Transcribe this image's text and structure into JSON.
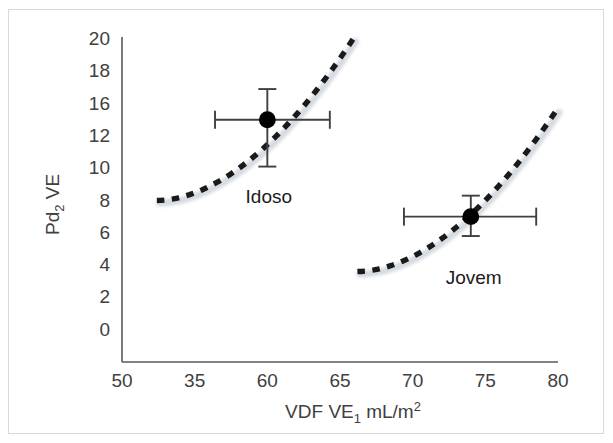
{
  "chart_data": {
    "type": "scatter",
    "title": "",
    "xlabel": "VDF VE₁ mL/m²",
    "ylabel": "Pd₂ VE",
    "xlabel_parts": {
      "prefix": "VDF VE",
      "sub": "1",
      "suffix": " mL/m",
      "sup": "2"
    },
    "ylabel_parts": {
      "prefix": "Pd",
      "sub": "2",
      "suffix": " VE"
    },
    "xlim": [
      50,
      80
    ],
    "ylim": [
      0,
      20
    ],
    "xticks": [
      "50",
      "35",
      "60",
      "65",
      "70",
      "75",
      "80"
    ],
    "xtick_values": [
      50,
      55,
      60,
      65,
      70,
      75,
      80
    ],
    "yticks": [
      "20",
      "18",
      "16",
      "12",
      "10",
      "8",
      "6",
      "4",
      "2",
      "0"
    ],
    "ytick_values": [
      20,
      18,
      16,
      14,
      12,
      10,
      8,
      6,
      4,
      2,
      0
    ],
    "ytick_positions": [
      20,
      18,
      16,
      14,
      12,
      10,
      8,
      6,
      4,
      2,
      0
    ],
    "grid": false,
    "legend": "none",
    "axis_color": "#595959",
    "marker_color": "#000000",
    "errorbar_color": "#404040",
    "curve_color": "#1a1a1a",
    "curve_shadow_color": "#c8cfd8",
    "series": [
      {
        "name": "Idoso",
        "label": "Idoso",
        "x": 60,
        "y": 15,
        "xerr_low": 56.4,
        "xerr_high": 64.3,
        "yerr_low": 12.1,
        "yerr_high": 16.9,
        "label_x": 60.1,
        "label_y": 10.9,
        "curve": {
          "x_start": 52.4,
          "x_end": 65.9,
          "y_start": 10.0,
          "y_end": 20.0
        }
      },
      {
        "name": "Jovem",
        "label": "Jovem",
        "x": 74,
        "y": 9,
        "xerr_low": 69.4,
        "xerr_high": 78.5,
        "yerr_low": 7.8,
        "yerr_high": 10.3,
        "label_x": 74.2,
        "label_y": 5.9,
        "curve": {
          "x_start": 66.2,
          "x_end": 79.9,
          "y_start": 5.6,
          "y_end": 15.6
        }
      }
    ]
  }
}
